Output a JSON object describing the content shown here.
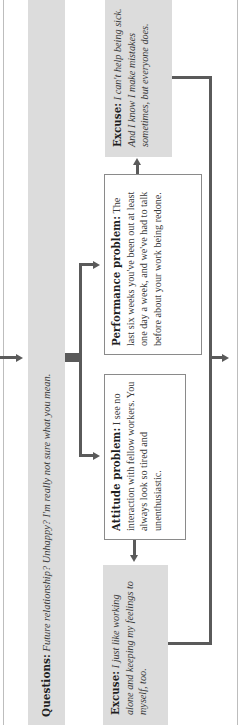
{
  "diagram": {
    "orientation": "rotated 90 degrees counterclockwise",
    "colors": {
      "band_gray": "#dcdcdc",
      "line_gray": "#5a5a5a",
      "box_border": "#8a8a8a",
      "frame": "#bdbdbd"
    },
    "questions": {
      "label": "Questions:",
      "text": "Future relationship? Unhappy? I'm really not sure what you mean."
    },
    "attitude_problem": {
      "label": "Attitude problem:",
      "text": "I see no interaction with fellow workers. You always look so tired and unenthusiastic."
    },
    "performance_problem": {
      "label": "Performance problem:",
      "text": "The last six weeks you've been out at least one day a week, and we've had to talk before about your work being redone."
    },
    "excuse_attitude": {
      "label": "Excuse:",
      "text": "I just like working alone and keeping my feelings to myself, too."
    },
    "excuse_performance": {
      "label": "Excuse:",
      "text": "I can't help being sick. And I know I make mistakes sometimes, but everyone does."
    }
  }
}
